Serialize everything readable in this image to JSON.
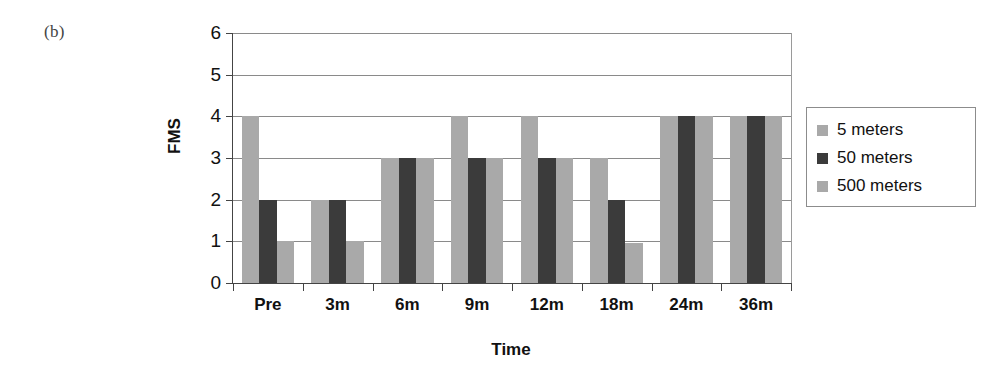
{
  "panel": {
    "label": "(b)"
  },
  "legend": {
    "position": "right",
    "entries": [
      {
        "label": "5 meters",
        "color": "#a9a9a9"
      },
      {
        "label": "50 meters",
        "color": "#3b3b3b"
      },
      {
        "label": "500 meters",
        "color": "#a9a9a9"
      }
    ]
  },
  "axes": {
    "y_title": "FMS",
    "x_title": "Time",
    "y_ticks": [
      "0",
      "1",
      "2",
      "3",
      "4",
      "5",
      "6"
    ],
    "x_ticks": [
      "Pre",
      "3m",
      "6m",
      "9m",
      "12m",
      "18m",
      "24m",
      "36m"
    ]
  },
  "chart_data": {
    "type": "bar",
    "title": "(b)",
    "xlabel": "Time",
    "ylabel": "FMS",
    "ylim": [
      0,
      6
    ],
    "ytick_values": [
      0,
      1,
      2,
      3,
      4,
      5,
      6
    ],
    "grid": true,
    "legend_position": "right",
    "categories": [
      "Pre",
      "3m",
      "6m",
      "9m",
      "12m",
      "18m",
      "24m",
      "36m"
    ],
    "series": [
      {
        "name": "5 meters",
        "color": "#a9a9a9",
        "values": [
          4,
          2,
          3,
          4,
          4,
          3,
          4,
          4
        ]
      },
      {
        "name": "50 meters",
        "color": "#3b3b3b",
        "values": [
          2,
          2,
          3,
          3,
          3,
          2,
          4,
          4
        ]
      },
      {
        "name": "500 meters",
        "color": "#a9a9a9",
        "values": [
          1,
          1,
          3,
          3,
          3,
          0.95,
          4,
          4
        ]
      }
    ]
  }
}
